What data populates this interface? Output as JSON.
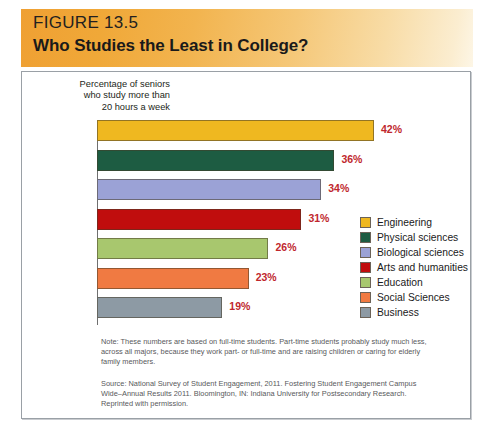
{
  "figure": {
    "number": "FIGURE 13.5",
    "title": "Who Studies the Least in College?"
  },
  "chart_data": {
    "type": "bar",
    "orientation": "horizontal",
    "title": "Who Studies the Least in College?",
    "axis_caption": "Percentage of seniors who study more than 20 hours a week",
    "axis_caption_lines": [
      "Percentage of seniors",
      "who study more than",
      "20 hours a week"
    ],
    "categories": [
      "Engineering",
      "Physical sciences",
      "Biological sciences",
      "Arts and humanities",
      "Education",
      "Social Sciences",
      "Business"
    ],
    "values": [
      42,
      36,
      34,
      31,
      26,
      23,
      19
    ],
    "value_labels": [
      "42%",
      "36%",
      "34%",
      "31%",
      "26%",
      "23%",
      "19%"
    ],
    "colors": [
      "#efb820",
      "#1d5c42",
      "#9ba2d6",
      "#c00d0d",
      "#a8c76e",
      "#f07a42",
      "#8d9aa4"
    ],
    "xlabel": "",
    "ylabel": "",
    "xlim": [
      0,
      48
    ],
    "grid": false,
    "legend_position": "right-middle"
  },
  "bars": [
    {
      "label": "Engineering",
      "value": 42,
      "value_label": "42%",
      "color": "#efb820"
    },
    {
      "label": "Physical sciences",
      "value": 36,
      "value_label": "36%",
      "color": "#1d5c42"
    },
    {
      "label": "Biological sciences",
      "value": 34,
      "value_label": "34%",
      "color": "#9ba2d6"
    },
    {
      "label": "Arts and humanities",
      "value": 31,
      "value_label": "31%",
      "color": "#c00d0d"
    },
    {
      "label": "Education",
      "value": 26,
      "value_label": "26%",
      "color": "#a8c76e"
    },
    {
      "label": "Social Sciences",
      "value": 23,
      "value_label": "23%",
      "color": "#f07a42"
    },
    {
      "label": "Business",
      "value": 19,
      "value_label": "19%",
      "color": "#8d9aa4"
    }
  ],
  "legend": {
    "items": [
      {
        "label": "Engineering",
        "color": "#efb820"
      },
      {
        "label": "Physical sciences",
        "color": "#1d5c42"
      },
      {
        "label": "Biological sciences",
        "color": "#9ba2d6"
      },
      {
        "label": "Arts and humanities",
        "color": "#c00d0d"
      },
      {
        "label": "Education",
        "color": "#a8c76e"
      },
      {
        "label": "Social Sciences",
        "color": "#f07a42"
      },
      {
        "label": "Business",
        "color": "#8d9aa4"
      }
    ]
  },
  "footnotes": {
    "note": "Note: These numbers are based on full-time students. Part-time students probably study much less, across all majors, because they work part- or full-time and are raising children or caring for elderly family members.",
    "source": "Source: National Survey of Student Engagement, 2011. Fostering Student Engagement Campus Wide–Annual Results 2011. Bloomington, IN: Indiana University for Postsecondary Research. Reprinted with permission."
  },
  "colors": {
    "header_start": "#efa033",
    "header_end": "#fdf6e6",
    "value_label": "#c0272d",
    "panel_border": "#9aa0a6"
  }
}
